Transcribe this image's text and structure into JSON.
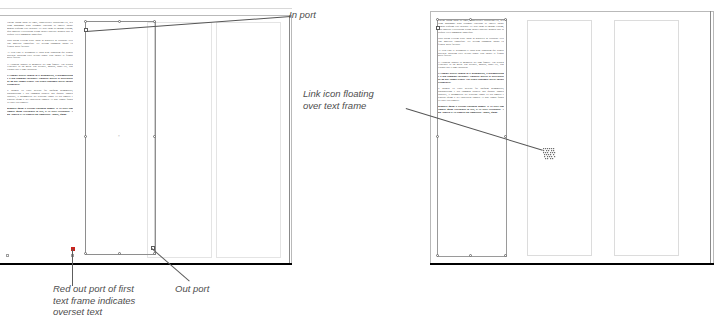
{
  "document": {
    "application": "InDesign",
    "view": "spread-layout-illustration",
    "figure_kind": "two-panel instructional diagram"
  },
  "panels": [
    {
      "id": "left-panel",
      "name": "overset-text-panel",
      "description": "Left spread showing a selected text frame whose out port is red, indicating overset text.",
      "page": {
        "columns": 3,
        "text_columns_filled": 1,
        "selected_frame": true
      },
      "callouts": [
        {
          "id": "in-port",
          "label": "In port",
          "anchor": "top-left of selected text frame"
        },
        {
          "id": "out-port",
          "label": "Out port",
          "anchor": "bottom-right of selected text frame"
        },
        {
          "id": "red-out-port",
          "label": "Red out port of first\ntext frame indicates\noverset text",
          "anchor": "bottom-left corner of first text column"
        }
      ]
    },
    {
      "id": "right-panel",
      "name": "loaded-link-icon-panel",
      "description": "Right spread showing the loaded text (link) icon hovering over an empty column of the text frame.",
      "page": {
        "columns": 3,
        "text_columns_filled": 1,
        "selected_frame": true
      },
      "callouts": [
        {
          "id": "link-icon",
          "label": "Link icon floating\nover text frame",
          "anchor": "loaded text cursor over second column"
        }
      ]
    }
  ],
  "icons": {
    "link_cursor": "loaded-text-link-icon",
    "in_port": "in-port-square",
    "out_port": "out-port-square",
    "out_port_overset": "red-out-port-square"
  },
  "colors": {
    "overset_red": "#c9231d",
    "frame_stroke": "#8e8e8e",
    "column_guide": "#dcdcdc",
    "page_border": "#b9b9b9",
    "callout_text": "#4e4e4e",
    "leader_line": "#5d5d5d",
    "body_text": "#3a3a3a"
  },
  "body_text": {
    "paragraphs": [
      {
        "bold": false,
        "text": "Lorem ipsum dolor sit amet, consectetuer adipiscing elit, sed diam nonummy nibh euismod tincidunt ut laoreet dolore magna aliquam erat volutpat. Ut wisi enim ad minim veniam, quis nostrud exercitation ullam corper suscipit lobortis nisl ut aliquip exea commodo consequat."
      },
      {
        "bold": false,
        "text": "Duis autem veleum iriure dolor in hendrerit in vulputate velit esse molestie consequat. Vel willum lunombro dolore eu feugiat nulla facilisis."
      },
      {
        "bold": false,
        "text": "At vero eros et accumsan et iusto odio dignissim qui blandit praesent luptatum zzril delenit augue duis dolore te feugait nulla facilisi."
      },
      {
        "bold": false,
        "text": "Li Europan lingues es membres del sam familie. Lor separat existentie es un myth. Por scientie, musica, sport etc, litot Europa usa li sam vocabular."
      },
      {
        "bold": true,
        "text": "Li lingues differe solmen in li grammatica, li pronunciation e li plu commun vocabules. Omnicos directe al desirabilite de un nov lingua franca: On refusa continuar payar custosi traductores."
      },
      {
        "bold": false,
        "text": "It solmen va esser necessi far uniform grammatica, pronunciation e plu commun paroles. Ma quande lingues coalesce, li grammatica del resultant lingue es plu simplic e regulari quam ti del coalescent lingues. Li nov lingua franca va esser plu simplic."
      },
      {
        "bold": true,
        "text": "Regulari quam li existent Europan lingues. It va esser tam simplic quam Occidental in fact, it va esser Occidental. A un Angleso it va semblar un simplificat Angles, quam."
      }
    ]
  }
}
